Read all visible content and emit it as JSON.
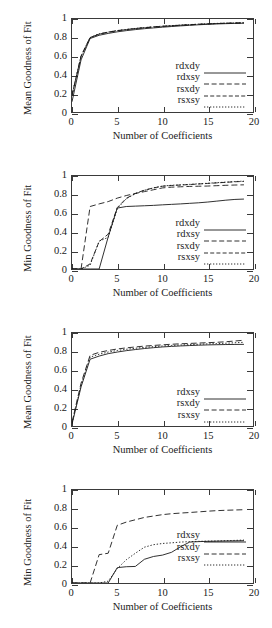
{
  "figure": {
    "panel_count": 4,
    "xlabel": "Number of Coefficients",
    "xticks": [
      "0",
      "5",
      "10",
      "15",
      "20"
    ],
    "yticks": [
      "0",
      "0.2",
      "0.4",
      "0.6",
      "0.8",
      "1"
    ],
    "ink_color": "#1a1a1a"
  },
  "panels": [
    {
      "ylabel": "Mean Goodness of Fit",
      "legend": [
        "rdxdy",
        "rdxsy",
        "rsxdy",
        "rsxsy"
      ]
    },
    {
      "ylabel": "Min Goodness of Fit",
      "legend": [
        "rdxdy",
        "rdxsy",
        "rsxdy",
        "rsxsy"
      ]
    },
    {
      "ylabel": "Mean Goodness of Fit",
      "legend": [
        "rdxsy",
        "rsxdy",
        "rsxsy"
      ]
    },
    {
      "ylabel": "Min Goodness of Fit",
      "legend": [
        "rdxsy",
        "rsxdy",
        "rsxsy"
      ]
    }
  ],
  "chart_data": [
    {
      "type": "line",
      "title": "",
      "xlabel": "Number of Coefficients",
      "ylabel": "Mean Goodness of Fit",
      "xlim": [
        0,
        20
      ],
      "ylim": [
        0,
        1
      ],
      "xticks": [
        0,
        5,
        10,
        15,
        20
      ],
      "yticks": [
        0,
        0.2,
        0.4,
        0.6,
        0.8,
        1
      ],
      "grid": false,
      "legend_position": "lower-right-inside",
      "x": [
        0,
        1,
        2,
        3,
        4,
        5,
        6,
        7,
        8,
        9,
        10,
        11,
        12,
        13,
        14,
        15,
        16,
        17,
        18,
        19
      ],
      "series": [
        {
          "name": "rdxdy",
          "dash": "solid",
          "values": [
            0.11,
            0.56,
            0.79,
            0.825,
            0.845,
            0.862,
            0.875,
            0.886,
            0.896,
            0.904,
            0.912,
            0.919,
            0.926,
            0.932,
            0.938,
            0.943,
            0.947,
            0.95,
            0.953,
            0.955
          ]
        },
        {
          "name": "rdxsy",
          "dash": "dashed",
          "values": [
            0.18,
            0.6,
            0.8,
            0.838,
            0.858,
            0.874,
            0.886,
            0.897,
            0.906,
            0.914,
            0.921,
            0.927,
            0.933,
            0.938,
            0.943,
            0.947,
            0.951,
            0.954,
            0.956,
            0.958
          ]
        },
        {
          "name": "rsxdy",
          "dash": "dash-dot",
          "values": [
            0.18,
            0.6,
            0.8,
            0.838,
            0.858,
            0.874,
            0.886,
            0.897,
            0.906,
            0.914,
            0.921,
            0.927,
            0.933,
            0.938,
            0.943,
            0.947,
            0.951,
            0.954,
            0.956,
            0.958
          ]
        },
        {
          "name": "rsxsy",
          "dash": "dotted",
          "values": [
            0.18,
            0.6,
            0.8,
            0.84,
            0.86,
            0.876,
            0.888,
            0.899,
            0.908,
            0.916,
            0.923,
            0.929,
            0.935,
            0.94,
            0.945,
            0.949,
            0.953,
            0.956,
            0.958,
            0.96
          ]
        }
      ]
    },
    {
      "type": "line",
      "title": "",
      "xlabel": "Number of Coefficients",
      "ylabel": "Min Goodness of Fit",
      "xlim": [
        0,
        20
      ],
      "ylim": [
        0,
        1
      ],
      "xticks": [
        0,
        5,
        10,
        15,
        20
      ],
      "yticks": [
        0,
        0.2,
        0.4,
        0.6,
        0.8,
        1
      ],
      "grid": false,
      "legend_position": "lower-right-inside",
      "x": [
        0,
        1,
        2,
        3,
        4,
        5,
        6,
        7,
        8,
        9,
        10,
        11,
        12,
        13,
        14,
        15,
        16,
        17,
        18,
        19
      ],
      "series": [
        {
          "name": "rdxdy",
          "dash": "solid",
          "values": [
            0.0,
            0.0,
            0.0,
            0.0,
            0.345,
            0.655,
            0.672,
            0.676,
            0.68,
            0.684,
            0.69,
            0.695,
            0.7,
            0.706,
            0.712,
            0.72,
            0.73,
            0.74,
            0.748,
            0.752
          ]
        },
        {
          "name": "rdxsy",
          "dash": "dashed",
          "values": [
            0.0,
            0.0,
            0.672,
            0.7,
            0.725,
            0.762,
            0.79,
            0.812,
            0.832,
            0.852,
            0.872,
            0.88,
            0.884,
            0.888,
            0.89,
            0.892,
            0.896,
            0.9,
            0.903,
            0.905
          ]
        },
        {
          "name": "rsxdy",
          "dash": "dash-dot",
          "values": [
            0.0,
            0.0,
            0.055,
            0.295,
            0.375,
            0.66,
            0.76,
            0.812,
            0.848,
            0.872,
            0.89,
            0.898,
            0.903,
            0.908,
            0.914,
            0.92,
            0.926,
            0.932,
            0.938,
            0.942
          ]
        },
        {
          "name": "rsxsy",
          "dash": "dotted",
          "values": [
            0.0,
            0.0,
            0.04,
            0.3,
            0.34,
            0.65,
            0.755,
            0.81,
            0.846,
            0.872,
            0.892,
            0.9,
            0.905,
            0.91,
            0.916,
            0.922,
            0.928,
            0.934,
            0.94,
            0.945
          ]
        }
      ]
    },
    {
      "type": "line",
      "title": "",
      "xlabel": "Number of Coefficients",
      "ylabel": "Mean Goodness of Fit",
      "xlim": [
        0,
        20
      ],
      "ylim": [
        0,
        1
      ],
      "xticks": [
        0,
        5,
        10,
        15,
        20
      ],
      "yticks": [
        0,
        0.2,
        0.4,
        0.6,
        0.8,
        1
      ],
      "grid": false,
      "legend_position": "lower-right-inside",
      "x": [
        0,
        1,
        2,
        3,
        4,
        5,
        6,
        7,
        8,
        9,
        10,
        11,
        12,
        13,
        14,
        15,
        16,
        17,
        18,
        19
      ],
      "series": [
        {
          "name": "rdxsy",
          "dash": "solid",
          "values": [
            0.02,
            0.42,
            0.718,
            0.752,
            0.778,
            0.795,
            0.81,
            0.822,
            0.833,
            0.842,
            0.85,
            0.856,
            0.861,
            0.865,
            0.869,
            0.872,
            0.874,
            0.876,
            0.877,
            0.878
          ]
        },
        {
          "name": "rsxdy",
          "dash": "dashed",
          "values": [
            0.04,
            0.46,
            0.76,
            0.792,
            0.812,
            0.828,
            0.84,
            0.85,
            0.859,
            0.866,
            0.873,
            0.879,
            0.884,
            0.888,
            0.892,
            0.896,
            0.9,
            0.906,
            0.914,
            0.922
          ]
        },
        {
          "name": "rsxsy",
          "dash": "dotted",
          "values": [
            0.03,
            0.44,
            0.74,
            0.772,
            0.795,
            0.812,
            0.825,
            0.836,
            0.845,
            0.853,
            0.86,
            0.866,
            0.871,
            0.875,
            0.879,
            0.883,
            0.886,
            0.89,
            0.895,
            0.9
          ]
        }
      ]
    },
    {
      "type": "line",
      "title": "",
      "xlabel": "Number of Coefficients",
      "ylabel": "Min Goodness of Fit",
      "xlim": [
        0,
        20
      ],
      "ylim": [
        0,
        1
      ],
      "xticks": [
        0,
        5,
        10,
        15,
        20
      ],
      "yticks": [
        0,
        0.2,
        0.4,
        0.6,
        0.8,
        1
      ],
      "grid": false,
      "legend_position": "middle-right-inside",
      "x": [
        0,
        1,
        2,
        3,
        4,
        5,
        6,
        7,
        8,
        9,
        10,
        11,
        12,
        13,
        14,
        15,
        16,
        17,
        18,
        19
      ],
      "series": [
        {
          "name": "rdxsy",
          "dash": "solid",
          "values": [
            0.0,
            0.0,
            0.0,
            0.0,
            0.0,
            0.165,
            0.175,
            0.178,
            0.255,
            0.285,
            0.3,
            0.33,
            0.39,
            0.44,
            0.445,
            0.448,
            0.45,
            0.452,
            0.453,
            0.455
          ]
        },
        {
          "name": "rsxdy",
          "dash": "dashed",
          "values": [
            0.0,
            0.0,
            0.0,
            0.305,
            0.32,
            0.62,
            0.655,
            0.68,
            0.705,
            0.72,
            0.735,
            0.745,
            0.752,
            0.758,
            0.765,
            0.772,
            0.778,
            0.782,
            0.785,
            0.788
          ]
        },
        {
          "name": "rsxsy",
          "dash": "dotted",
          "values": [
            0.0,
            0.0,
            0.0,
            0.0,
            0.02,
            0.155,
            0.25,
            0.32,
            0.385,
            0.412,
            0.425,
            0.432,
            0.44,
            0.445,
            0.448,
            0.45,
            0.452,
            0.455,
            0.458,
            0.462
          ]
        }
      ]
    }
  ]
}
